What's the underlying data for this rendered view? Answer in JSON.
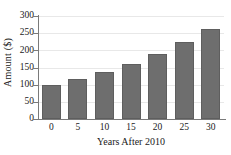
{
  "chart_data": {
    "type": "bar",
    "title": "",
    "subtitle": "",
    "xlabel": "Years After 2010",
    "ylabel": "Amount ($)",
    "categories": [
      "0",
      "5",
      "10",
      "15",
      "20",
      "25",
      "30"
    ],
    "values": [
      98,
      117,
      137,
      160,
      190,
      223,
      261
    ],
    "xlim": [
      0,
      30
    ],
    "ylim": [
      0,
      300
    ],
    "y_ticks": [
      "0",
      "50",
      "100",
      "150",
      "200",
      "250",
      "300"
    ],
    "y_tick_values": [
      0,
      50,
      100,
      150,
      200,
      250,
      300
    ],
    "x_ticks": [
      "0",
      "5",
      "10",
      "15",
      "20",
      "25",
      "30"
    ],
    "grid": true,
    "grid_axis": "y",
    "legend": false,
    "legend_position": "none",
    "bar_color": "#6e6e6e",
    "grid_color": "#e8e8e8",
    "axis_color": "#7a7a7a",
    "background_color": "#ffffff"
  }
}
